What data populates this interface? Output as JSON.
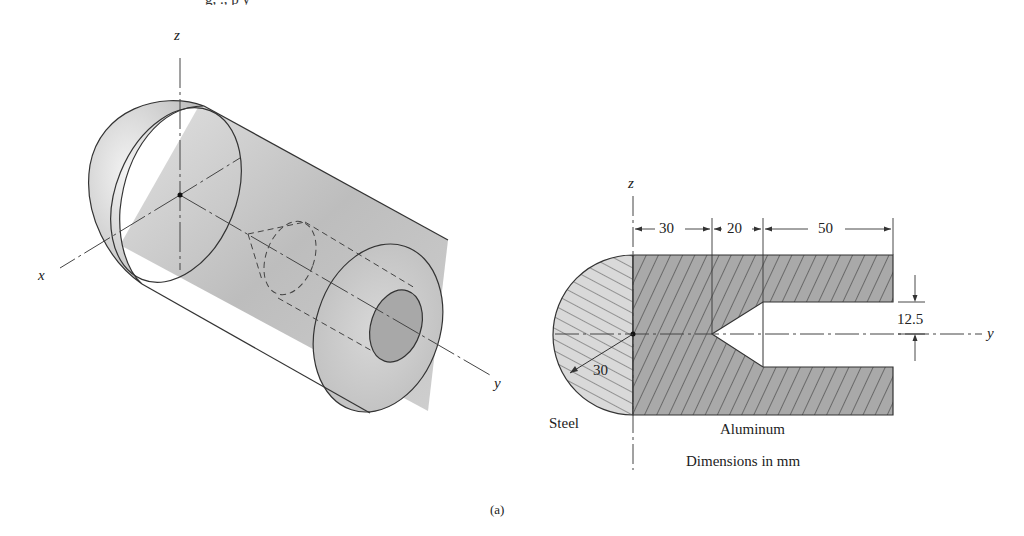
{
  "figure": {
    "caption": "(a)",
    "top_clipped_text": "g, ., p y"
  },
  "isometric_view": {
    "axis_labels": {
      "x": "x",
      "y": "y",
      "z": "z"
    },
    "description": "Composite cylinder: hemispherical steel end cap joined to aluminum cylinder with internal conical-tipped bore"
  },
  "section_view": {
    "axis_labels": {
      "z": "z",
      "y": "y"
    },
    "dimensions": {
      "steel_radius": "30",
      "segment_1": "30",
      "segment_2": "20",
      "segment_3": "50",
      "bore_radius": "12.5"
    },
    "materials": {
      "left": "Steel",
      "right": "Aluminum"
    },
    "units_note": "Dimensions in mm"
  },
  "colors": {
    "aluminum_fill": "#a9a9a9",
    "steel_fill": "#d6d6d6",
    "cylinder_shade": "#c8c8c8",
    "line": "#333333"
  }
}
